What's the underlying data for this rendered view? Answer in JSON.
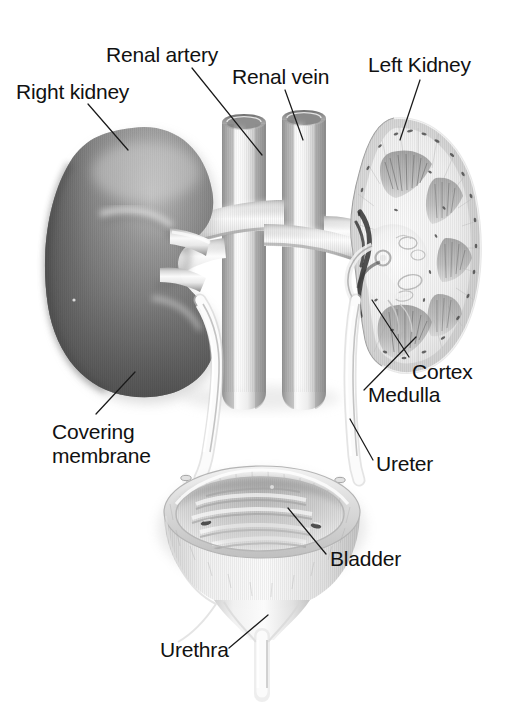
{
  "figure": {
    "background_color": "#ffffff",
    "ink_color": "#111111",
    "style": "grayscale medical illustration"
  },
  "labels": [
    {
      "id": "right-kidney",
      "text": "Right kidney",
      "lines": [
        "Right kidney"
      ]
    },
    {
      "id": "renal-artery",
      "text": "Renal artery",
      "lines": [
        "Renal artery"
      ]
    },
    {
      "id": "renal-vein",
      "text": "Renal vein",
      "lines": [
        "Renal vein"
      ]
    },
    {
      "id": "left-kidney",
      "text": "Left Kidney",
      "lines": [
        "Left Kidney"
      ]
    },
    {
      "id": "cortex",
      "text": "Cortex",
      "lines": [
        "Cortex"
      ]
    },
    {
      "id": "medulla",
      "text": "Medulla",
      "lines": [
        "Medulla"
      ]
    },
    {
      "id": "ureter",
      "text": "Ureter",
      "lines": [
        "Ureter"
      ]
    },
    {
      "id": "covering-membrane",
      "text": "Covering\nmembrane",
      "lines": [
        "Covering",
        "membrane"
      ]
    },
    {
      "id": "bladder",
      "text": "Bladder",
      "lines": [
        "Bladder"
      ]
    },
    {
      "id": "urethra",
      "text": "Urethra",
      "lines": [
        "Urethra"
      ]
    }
  ],
  "structures": [
    {
      "name": "right-kidney",
      "description": "whole bean-shaped kidney, dark gray shaded, hilum facing right"
    },
    {
      "name": "left-kidney",
      "description": "coronal sectioned kidney showing cortex, medullary pyramids, renal pelvis"
    },
    {
      "name": "aorta",
      "description": "left vertical vessel, cut open at top, branches to renal artery"
    },
    {
      "name": "inferior-vena-cava",
      "description": "right vertical vessel, cut open at top, receives renal veins"
    },
    {
      "name": "renal-artery",
      "description": "horizontal vessel from aorta to each kidney hilum"
    },
    {
      "name": "renal-vein",
      "description": "horizontal vessel from kidney hilum to vena cava"
    },
    {
      "name": "right-ureter",
      "description": "pale tube descending from right kidney to bladder"
    },
    {
      "name": "left-ureter",
      "description": "pale tube descending from left kidney hilum to bladder"
    },
    {
      "name": "bladder",
      "description": "opened cup-shaped bladder with thick rim, rugae folds and two ureteral orifices"
    },
    {
      "name": "urethra",
      "description": "narrow tube descending from bladder neck"
    },
    {
      "name": "covering-membrane",
      "description": "renal capsule surface of the right kidney"
    },
    {
      "name": "cortex",
      "description": "outer pale band of sectioned kidney with speckled vessels"
    },
    {
      "name": "medulla",
      "description": "inner striated fan-shaped pyramids of sectioned kidney"
    }
  ],
  "leader_lines": [
    {
      "for": "right-kidney",
      "from": [
        88,
        104
      ],
      "to": [
        128,
        150
      ]
    },
    {
      "for": "renal-artery",
      "from": [
        192,
        68
      ],
      "to": [
        262,
        155
      ]
    },
    {
      "for": "renal-vein",
      "from": [
        285,
        90
      ],
      "to": [
        303,
        140
      ]
    },
    {
      "for": "left-kidney",
      "from": [
        420,
        80
      ],
      "to": [
        400,
        140
      ]
    },
    {
      "for": "cortex",
      "from": [
        409,
        357
      ],
      "to": [
        372,
        300
      ]
    },
    {
      "for": "medulla",
      "from": [
        364,
        390
      ],
      "to": [
        416,
        337
      ]
    },
    {
      "for": "ureter",
      "from": [
        373,
        460
      ],
      "to": [
        350,
        419
      ]
    },
    {
      "for": "covering-membrane",
      "from": [
        96,
        414
      ],
      "to": [
        135,
        372
      ]
    },
    {
      "for": "bladder",
      "from": [
        326,
        554
      ],
      "to": [
        288,
        508
      ]
    },
    {
      "for": "urethra",
      "from": [
        229,
        648
      ],
      "to": [
        268,
        615
      ]
    }
  ]
}
